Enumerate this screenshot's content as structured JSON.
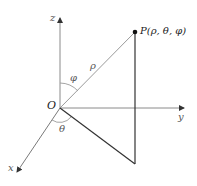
{
  "diagram": {
    "origin_label": "O",
    "axes": {
      "x": {
        "label": "x"
      },
      "y": {
        "label": "y"
      },
      "z": {
        "label": "z"
      }
    },
    "point": {
      "label": "P(ρ, θ, φ)"
    },
    "angles": {
      "rho": "ρ",
      "phi": "φ",
      "theta": "θ"
    },
    "colors": {
      "axis": "#8a8a8a",
      "rho_line": "#9a9a9a",
      "projection_line": "#333333",
      "point": "#111111",
      "background": "#ffffff"
    }
  }
}
